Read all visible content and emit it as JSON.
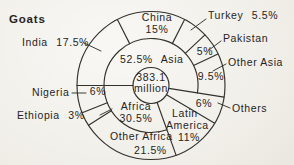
{
  "title": "Goats",
  "colors": {
    "background": "#f1efe9",
    "line": "#33312b",
    "text": "#26241d"
  },
  "chart_data": {
    "type": "pie",
    "subtype": "nested-donut",
    "title": "Goats",
    "center_total": {
      "value": 383.1,
      "unit": "million",
      "display": "383.1 million"
    },
    "direction": "clockwise",
    "start_angle_deg": 270,
    "inner_ring": [
      {
        "label": "Asia",
        "value": 52.5
      },
      {
        "label": "Others",
        "value": 6
      },
      {
        "label": "Latin America",
        "value": 11
      },
      {
        "label": "Africa",
        "value": 30.5
      }
    ],
    "outer_ring": [
      {
        "label": "India",
        "value": 17.5,
        "group": "Asia"
      },
      {
        "label": "China",
        "value": 15,
        "group": "Asia"
      },
      {
        "label": "Turkey",
        "value": 5.5,
        "group": "Asia"
      },
      {
        "label": "Pakistan",
        "value": 5,
        "group": "Asia"
      },
      {
        "label": "Other Asia",
        "value": 9.5,
        "group": "Asia"
      },
      {
        "label": "Others",
        "value": 6,
        "group": ""
      },
      {
        "label": "Latin America",
        "value": 11,
        "group": ""
      },
      {
        "label": "Other Africa",
        "value": 21.5,
        "group": "Africa"
      },
      {
        "label": "Ethiopia",
        "value": 3,
        "group": "Africa"
      },
      {
        "label": "Nigeria",
        "value": 6,
        "group": "Africa"
      }
    ],
    "segments_spanning_both_rings": [
      "Others",
      "Latin America"
    ]
  },
  "labels": {
    "title": "Goats",
    "india": "India 17.5%",
    "china_name": "China",
    "china_pct": "15%",
    "turkey": "Turkey 5.5%",
    "pakistan_name": "Pakistan",
    "pakistan_pct": "5%",
    "other_asia_name": "Other Asia",
    "other_asia_pct": "9.5%",
    "asia_inner": "52.5% Asia",
    "center_value": "383.1",
    "center_unit": "million",
    "nigeria_name": "Nigeria",
    "nigeria_pct": "6%",
    "ethiopia": "Ethiopia 3%",
    "africa_name": "Africa",
    "africa_pct": "30.5%",
    "other_africa_name": "Other Africa",
    "other_africa_pct": "21.5%",
    "latin_line1": "Latin",
    "latin_line2": "America",
    "latin_line3": "11%",
    "others_pct": "6%",
    "others_name": "Others"
  }
}
